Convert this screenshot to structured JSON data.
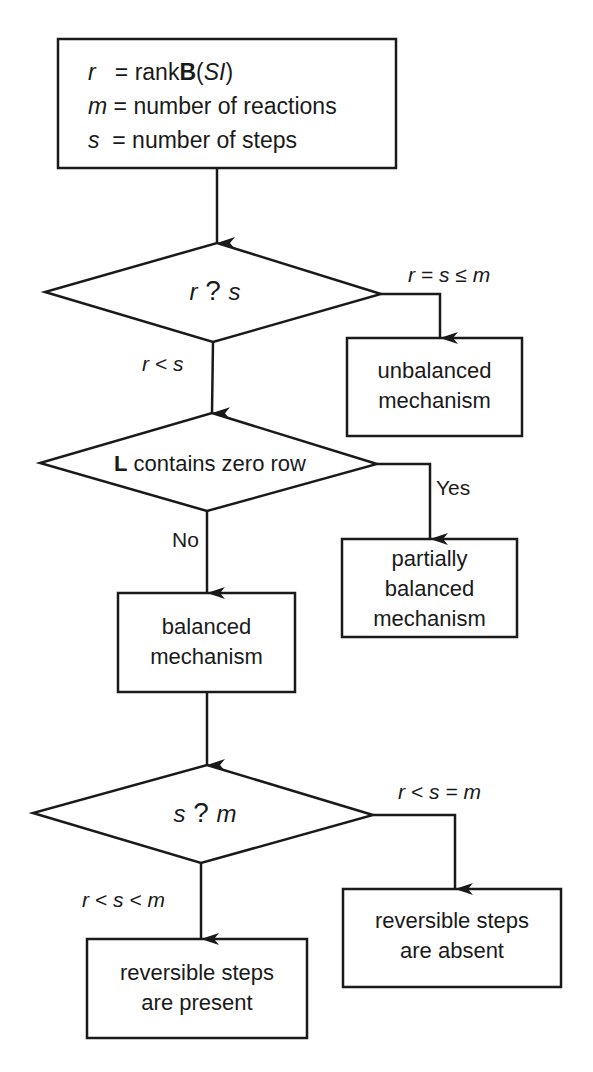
{
  "definitions": {
    "r_symbol": "r",
    "r_eq": " = rank",
    "r_matrix": "B",
    "r_arg_open": "(",
    "r_arg": "SI",
    "r_arg_close": ")",
    "m_symbol": "m",
    "m_text": " = number of reactions",
    "s_symbol": "s",
    "s_text": " = number of steps"
  },
  "decision1": {
    "left": "r",
    "op": " ? ",
    "right": "s"
  },
  "decision1_branches": {
    "right_label": {
      "a": "r",
      "op1": " = ",
      "b": "s",
      "op2": " ≤ ",
      "c": "m"
    },
    "down_label": {
      "a": "r",
      "op1": " < ",
      "b": "s"
    }
  },
  "unbalanced": {
    "line1": "unbalanced",
    "line2": "mechanism"
  },
  "decision2": {
    "bold": "L",
    "text": " contains zero row"
  },
  "decision2_branches": {
    "yes": "Yes",
    "no": "No"
  },
  "partially_balanced": {
    "line1": "partially",
    "line2": "balanced",
    "line3": "mechanism"
  },
  "balanced": {
    "line1": "balanced",
    "line2": "mechanism"
  },
  "decision3": {
    "left": "s",
    "op": " ? ",
    "right": "m"
  },
  "decision3_branches": {
    "right_label": {
      "a": "r",
      "op1": " < ",
      "b": "s",
      "op2": " = ",
      "c": "m"
    },
    "down_label": {
      "a": "r",
      "op1": " < ",
      "b": "s",
      "op2": " < ",
      "c": "m"
    }
  },
  "present": {
    "line1": "reversible steps",
    "line2": "are present"
  },
  "absent": {
    "line1": "reversible steps",
    "line2": "are absent"
  },
  "colors": {
    "stroke": "#1a1a1a",
    "background": "#ffffff"
  }
}
